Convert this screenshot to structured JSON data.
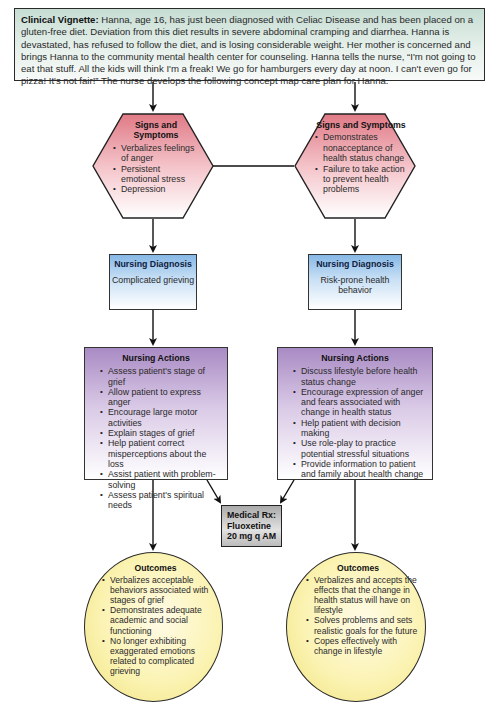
{
  "vignette": {
    "label": "Clinical Vignette:",
    "text": "Hanna, age 16, has just been diagnosed with Celiac Disease and has been placed on a gluten-free diet. Deviation from this diet results in severe abdominal cramping and diarrhea. Hanna is devastated, has refused to follow the diet, and is losing considerable weight. Her mother is concerned and brings Hanna to the community mental health center for counseling. Hanna tells the nurse, “I'm not going to eat that stuff. All the kids will think I'm a freak! We go for hamburgers every day at noon. I can't even go for pizza! It's not fair!” The nurse develops the following concept map care plan for Hanna."
  },
  "colors": {
    "vignette_bg": "#c6ddd3",
    "signs_fill": "#e07a86",
    "diagnosis_fill": "#86b8e6",
    "actions_fill": "#a98bc4",
    "rx_fill": "#aaaaaa",
    "outcomes_fill": "#fbf3b3"
  },
  "left": {
    "signs": {
      "title": "Signs and Symptoms",
      "items": [
        "Verbalizes feelings of anger",
        "Persistent emotional stress",
        "Depression"
      ]
    },
    "diagnosis": {
      "title": "Nursing Diagnosis",
      "value": "Complicated grieving"
    },
    "actions": {
      "title": "Nursing Actions",
      "items": [
        "Assess patient's stage of grief",
        "Allow patient to express anger",
        "Encourage large motor activities",
        "Explain stages of grief",
        "Help patient correct misperceptions about the loss",
        "Assist patient with problem-solving",
        "Assess patient's spiritual needs"
      ]
    },
    "outcomes": {
      "title": "Outcomes",
      "items": [
        "Verbalizes acceptable behaviors associated with stages of grief",
        "Demonstrates adequate academic and social functioning",
        "No longer exhibiting exaggerated emotions related to complicated grieving"
      ]
    }
  },
  "right": {
    "signs": {
      "title": "Signs and Symptoms",
      "items": [
        "Demonstrates nonacceptance of health status change",
        "Failure to take action to prevent health problems"
      ]
    },
    "diagnosis": {
      "title": "Nursing Diagnosis",
      "value": "Risk-prone health behavior"
    },
    "actions": {
      "title": "Nursing Actions",
      "items": [
        "Discuss lifestyle before health status change",
        "Encourage expression of anger and fears associated with change in health status",
        "Help patient with decision making",
        "Use role-play to practice potential stressful situations",
        "Provide information to patient and family about health change"
      ]
    },
    "outcomes": {
      "title": "Outcomes",
      "items": [
        "Verbalizes and accepts the effects that the change in health status will have on lifestyle",
        "Solves problems and sets realistic goals for the future",
        "Copes effectively with change in lifestyle"
      ]
    }
  },
  "medical_rx": {
    "line1": "Medical Rx:",
    "line2": "Fluoxetine",
    "line3": "20 mg q AM"
  }
}
